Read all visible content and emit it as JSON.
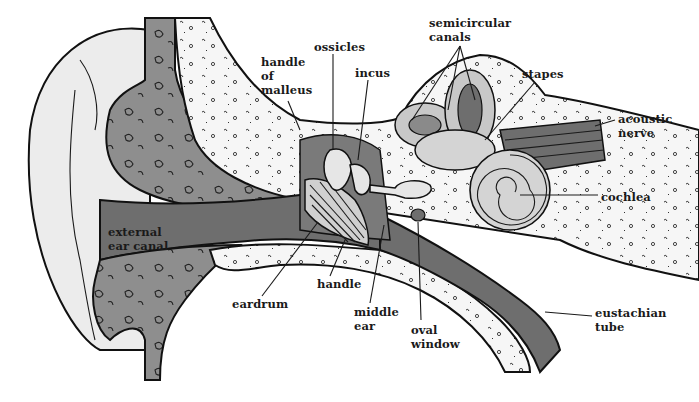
{
  "diagram": {
    "colors": {
      "background": "#ffffff",
      "light_tissue": "#ececec",
      "mid_gray": "#9a9a9a",
      "dark_gray": "#6e6e6e",
      "bone_light": "#f6f6f6",
      "outline": "#111111"
    },
    "labels": [
      {
        "id": "semicircular-canals",
        "text": "semicircular\ncanals",
        "x": 429,
        "y": 16
      },
      {
        "id": "ossicles",
        "text": "ossicles",
        "x": 314,
        "y": 40
      },
      {
        "id": "handle-of-malleus",
        "text": "handle\nof\nmalleus",
        "x": 261,
        "y": 55
      },
      {
        "id": "incus",
        "text": "incus",
        "x": 355,
        "y": 66
      },
      {
        "id": "stapes",
        "text": "stapes",
        "x": 522,
        "y": 67
      },
      {
        "id": "acoustic-nerve",
        "text": "acoustic\nnerve",
        "x": 618,
        "y": 112
      },
      {
        "id": "cochlea",
        "text": "cochlea",
        "x": 601,
        "y": 190
      },
      {
        "id": "external-ear-canal",
        "text": "external\near canal",
        "x": 108,
        "y": 225
      },
      {
        "id": "handle",
        "text": "handle",
        "x": 317,
        "y": 277
      },
      {
        "id": "eardrum",
        "text": "eardrum",
        "x": 232,
        "y": 297
      },
      {
        "id": "middle-ear",
        "text": "middle\near",
        "x": 354,
        "y": 305
      },
      {
        "id": "oval-window",
        "text": "oval\nwindow",
        "x": 411,
        "y": 323
      },
      {
        "id": "eustachian-tube",
        "text": "eustachian\ntube",
        "x": 595,
        "y": 306
      }
    ]
  }
}
